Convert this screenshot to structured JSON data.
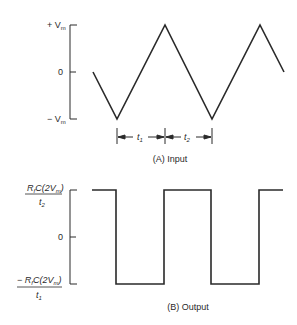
{
  "panel_a": {
    "caption": "(A) Input",
    "y_labels": {
      "top": "+ V",
      "top_sub": "m",
      "zero": "0",
      "bottom": "− V",
      "bottom_sub": "m"
    },
    "interval_labels": {
      "t1": "t",
      "t1_sub": "1",
      "t2": "t",
      "t2_sub": "2"
    },
    "waveform": "triangle"
  },
  "panel_b": {
    "caption": "(B) Output",
    "y_labels": {
      "top_num": "R",
      "top_num_sub": "f",
      "top_num_rest": "C(2V",
      "top_num_sub2": "m",
      "top_num_close": ")",
      "top_den": "t",
      "top_den_sub": "2",
      "zero": "0",
      "bottom_num_prefix": "− R",
      "bottom_num_sub": "f",
      "bottom_num_rest": "C(2V",
      "bottom_num_sub2": "m",
      "bottom_num_close": ")",
      "bottom_den": "t",
      "bottom_den_sub": "1"
    },
    "waveform": "square"
  },
  "colors": {
    "line": "#2a2a2a",
    "background": "#ffffff"
  }
}
